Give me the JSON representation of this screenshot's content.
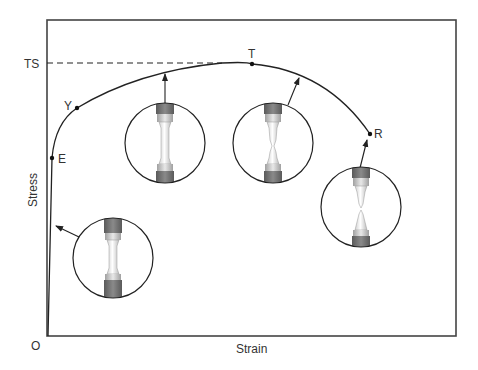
{
  "diagram": {
    "type": "stress-strain",
    "frame": {
      "x1": 47,
      "y1": 20,
      "x2": 456,
      "y2": 336
    },
    "axes": {
      "x_label": "Strain",
      "y_label": "Stress",
      "origin_label": "O",
      "ts_label": "TS"
    },
    "points": [
      {
        "id": "E",
        "label": "E",
        "x": 52,
        "y": 158,
        "meaning": "elastic limit"
      },
      {
        "id": "Y",
        "label": "Y",
        "x": 77,
        "y": 108,
        "meaning": "yield"
      },
      {
        "id": "T",
        "label": "T",
        "x": 252,
        "y": 64,
        "meaning": "tensile strength (max)"
      },
      {
        "id": "R",
        "label": "R",
        "x": 370,
        "y": 134,
        "meaning": "rupture / fracture"
      }
    ],
    "insets": [
      {
        "id": "elastic",
        "stage": "elastic deformation",
        "cx": 113,
        "cy": 258,
        "r": 40,
        "neck": 0
      },
      {
        "id": "uniform",
        "stage": "uniform plastic elongation",
        "cx": 165,
        "cy": 143,
        "r": 40,
        "neck": 0.15
      },
      {
        "id": "necking",
        "stage": "necking",
        "cx": 273,
        "cy": 143,
        "r": 40,
        "neck": 0.7
      },
      {
        "id": "fracture",
        "stage": "fracture",
        "cx": 361,
        "cy": 207,
        "r": 40,
        "neck": 1
      }
    ],
    "colors": {
      "line": "#222222",
      "frame": "#444444",
      "grip_dark": "#6e6e6e",
      "grip_light": "#bdbdbd",
      "specimen": "#f2f2f2",
      "text": "#333333"
    }
  }
}
